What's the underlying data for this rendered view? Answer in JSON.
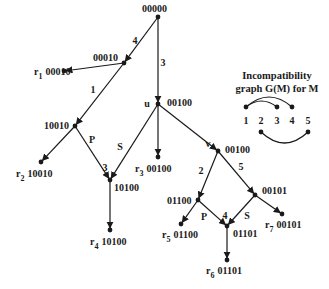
{
  "diagram": {
    "type": "tree",
    "nodes": [
      {
        "id": "n00000",
        "label": "00000",
        "x": 158,
        "y": 17,
        "lx": 142,
        "ly": 12
      },
      {
        "id": "n00010",
        "label": "00010",
        "x": 124,
        "y": 63,
        "lx": 93,
        "ly": 61
      },
      {
        "id": "r1",
        "label": "00010",
        "prefix": "r",
        "sub": "1",
        "x": 64,
        "y": 71,
        "lx": 34,
        "ly": 75
      },
      {
        "id": "u",
        "label": "00100",
        "name": "u",
        "x": 158,
        "y": 104,
        "lx": 167,
        "ly": 106
      },
      {
        "id": "n10010",
        "label": "10010",
        "x": 75,
        "y": 126,
        "lx": 44,
        "ly": 129
      },
      {
        "id": "r2",
        "label": "10010",
        "prefix": "r",
        "sub": "2",
        "x": 41,
        "y": 162,
        "lx": 16,
        "ly": 177
      },
      {
        "id": "r3",
        "label": "00100",
        "prefix": "r",
        "sub": "3",
        "x": 158,
        "y": 157,
        "lx": 135,
        "ly": 172
      },
      {
        "id": "v",
        "label": "00100",
        "name": "v",
        "x": 218,
        "y": 151,
        "lx": 225,
        "ly": 153
      },
      {
        "id": "n10100",
        "label": "10100",
        "x": 110,
        "y": 180,
        "lx": 114,
        "ly": 191
      },
      {
        "id": "r4",
        "label": "10100",
        "prefix": "r",
        "sub": "4",
        "x": 110,
        "y": 230,
        "lx": 90,
        "ly": 245
      },
      {
        "id": "n01100",
        "label": "01100",
        "x": 198,
        "y": 200,
        "lx": 167,
        "ly": 204
      },
      {
        "id": "n00101",
        "label": "00101",
        "x": 255,
        "y": 195,
        "lx": 262,
        "ly": 194
      },
      {
        "id": "r5",
        "label": "01100",
        "prefix": "r",
        "sub": "5",
        "x": 181,
        "y": 224,
        "lx": 162,
        "ly": 238
      },
      {
        "id": "n01101",
        "label": "01101",
        "x": 227,
        "y": 226,
        "lx": 233,
        "ly": 237
      },
      {
        "id": "r7",
        "label": "00101",
        "prefix": "r",
        "sub": "7",
        "x": 282,
        "y": 214,
        "lx": 265,
        "ly": 228
      },
      {
        "id": "r6",
        "label": "01101",
        "prefix": "r",
        "sub": "6",
        "x": 227,
        "y": 260,
        "lx": 206,
        "ly": 274
      }
    ],
    "edges": [
      {
        "from": "n00000",
        "to": "n00010",
        "label": "4",
        "lx": 135,
        "ly": 44
      },
      {
        "from": "n00000",
        "to": "u",
        "label": "3",
        "lx": 163,
        "ly": 66
      },
      {
        "from": "n00010",
        "to": "r1",
        "label": ""
      },
      {
        "from": "n00010",
        "to": "n10010",
        "label": "1",
        "lx": 93,
        "ly": 93
      },
      {
        "from": "u",
        "to": "r3",
        "label": ""
      },
      {
        "from": "u",
        "to": "v",
        "label": ""
      },
      {
        "from": "u",
        "to": "n10100",
        "label": "S",
        "lx": 120,
        "ly": 150
      },
      {
        "from": "n10010",
        "to": "r2",
        "label": ""
      },
      {
        "from": "n10010",
        "to": "n10100",
        "label": "P",
        "lx": 92,
        "ly": 143
      },
      {
        "from": "n10100",
        "to": "r4",
        "label": ""
      },
      {
        "from": "v",
        "to": "n01100",
        "label": "2",
        "lx": 201,
        "ly": 174
      },
      {
        "from": "v",
        "to": "n00101",
        "label": "5",
        "lx": 241,
        "ly": 170
      },
      {
        "from": "n01100",
        "to": "r5",
        "label": ""
      },
      {
        "from": "n01100",
        "to": "n01101",
        "label": "P",
        "lx": 204,
        "ly": 220
      },
      {
        "from": "n00101",
        "to": "n01101",
        "label": "S",
        "lx": 247,
        "ly": 219
      },
      {
        "from": "n00101",
        "to": "r7",
        "label": ""
      },
      {
        "from": "n01101",
        "to": "r6",
        "label": ""
      }
    ],
    "extra_edge_labels": [
      {
        "label": "3",
        "x": 105,
        "y": 171
      },
      {
        "label": "4",
        "x": 225,
        "y": 219
      }
    ],
    "node_names": [
      {
        "name": "u",
        "x": 147,
        "y": 107
      },
      {
        "name": "v",
        "x": 208,
        "y": 147
      }
    ]
  },
  "incompatibility_graph": {
    "title_line1": "Incompatibility",
    "title_line2": "graph G(M) for M",
    "nodes": [
      {
        "label": "1",
        "x": 246
      },
      {
        "label": "2",
        "x": 261
      },
      {
        "label": "3",
        "x": 277
      },
      {
        "label": "4",
        "x": 292
      },
      {
        "label": "5",
        "x": 308
      }
    ],
    "edges": [
      {
        "from": "1",
        "to": "3"
      },
      {
        "from": "1",
        "to": "4"
      },
      {
        "from": "2",
        "to": "5"
      }
    ]
  }
}
